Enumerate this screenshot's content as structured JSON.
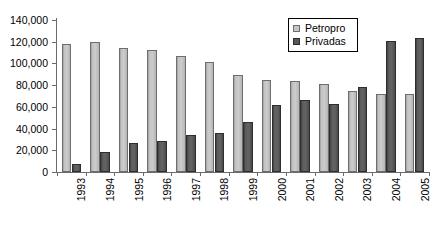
{
  "chart_data": {
    "type": "bar",
    "title": "",
    "xlabel": "",
    "ylabel": "",
    "ylim": [
      0,
      140000
    ],
    "ytick_labels": [
      "140,000",
      "120,000",
      "100,000",
      "80,000",
      "60,000",
      "40,000",
      "20,000",
      "0"
    ],
    "ytick_values": [
      140000,
      120000,
      100000,
      80000,
      60000,
      40000,
      20000,
      0
    ],
    "grid": false,
    "legend_position": "top-right",
    "categories": [
      "1993",
      "1994",
      "1995",
      "1996",
      "1997",
      "1998",
      "1999",
      "2000",
      "2001",
      "2002",
      "2003",
      "2004",
      "2005"
    ],
    "series": [
      {
        "name": "Petropro",
        "color": "#c6c6c6",
        "values": [
          118000,
          119500,
          114000,
          112000,
          106500,
          101500,
          89500,
          85000,
          83500,
          81000,
          74500,
          72000,
          71500
        ]
      },
      {
        "name": "Privadas",
        "color": "#575757",
        "values": [
          7000,
          18500,
          27000,
          28500,
          34500,
          35500,
          46500,
          61500,
          66000,
          63000,
          78500,
          120500,
          123000
        ]
      }
    ]
  },
  "legend": {
    "items": [
      {
        "label": "Petropro",
        "swatch": "light-square-icon"
      },
      {
        "label": "Privadas",
        "swatch": "dark-square-icon"
      }
    ]
  }
}
